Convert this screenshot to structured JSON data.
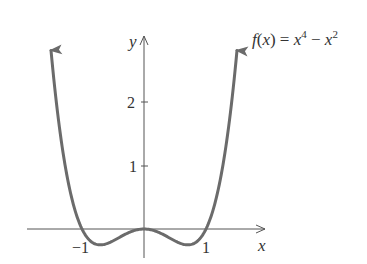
{
  "chart_data": {
    "type": "line",
    "function": "x^4 - x^2",
    "xlabel": "x",
    "ylabel": "y",
    "x_ticks": [
      -1,
      1
    ],
    "x_tick_labels": [
      "−1",
      "1"
    ],
    "y_ticks": [
      1,
      2
    ],
    "y_tick_labels": [
      "1",
      "2"
    ],
    "xlim": [
      -1.9,
      2.0
    ],
    "ylim": [
      -0.45,
      3.0
    ],
    "grid": false,
    "legend": null,
    "curve_color": "#6b6b6b",
    "series": [
      {
        "name": "f(x) = x^4 - x^2",
        "x": [
          -1.5,
          -1.25,
          -1.0,
          -0.707,
          -0.5,
          0.0,
          0.5,
          0.707,
          1.0,
          1.25,
          1.5
        ],
        "y": [
          2.8125,
          0.879,
          0.0,
          -0.25,
          -0.1875,
          0.0,
          -0.1875,
          -0.25,
          0.0,
          0.879,
          2.8125
        ]
      }
    ],
    "annotations": [
      {
        "text": "f(x) = x^4 − x^2",
        "position": "top-right"
      }
    ]
  },
  "labels": {
    "func_f": "f",
    "func_paren_open": "(",
    "func_x": "x",
    "func_paren_close": ") = ",
    "func_x1": "x",
    "func_exp1": "4",
    "func_minus": " − ",
    "func_x2": "x",
    "func_exp2": "2",
    "x_axis": "x",
    "y_axis": "y",
    "tick_x_neg1": "−1",
    "tick_x_1": "1",
    "tick_y_1": "1",
    "tick_y_2": "2"
  }
}
